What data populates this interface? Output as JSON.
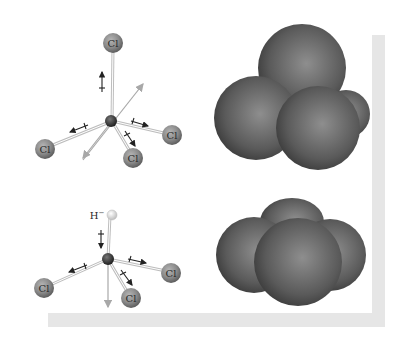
{
  "figure": {
    "molecules": [
      {
        "name": "carbon tetrachloride",
        "model": "ball-and-stick",
        "central_atom": "C",
        "atoms": [
          {
            "label": "Cl",
            "position": "top"
          },
          {
            "label": "Cl",
            "position": "left"
          },
          {
            "label": "Cl",
            "position": "right"
          },
          {
            "label": "Cl",
            "position": "front"
          }
        ],
        "net_dipole": "none (bond dipoles cancel)"
      },
      {
        "name": "chloroform",
        "model": "ball-and-stick",
        "central_atom": "C",
        "atoms": [
          {
            "label": "H",
            "position": "top"
          },
          {
            "label": "Cl",
            "position": "left"
          },
          {
            "label": "Cl",
            "position": "right"
          },
          {
            "label": "Cl",
            "position": "front"
          }
        ],
        "net_dipole": "downward"
      }
    ],
    "labels": {
      "cl": "Cl",
      "h": "H",
      "h_charge": "−"
    },
    "space_filling": [
      {
        "name": "carbon tetrachloride space-filling model"
      },
      {
        "name": "chloroform space-filling model"
      }
    ],
    "colors": {
      "chlorine": "#8a8a8a",
      "carbon": "#3a3a3a",
      "hydrogen": "#e8e8e8",
      "space_fill": "#5a5a5a",
      "shadow": "#e6e6e6",
      "net_arrow": "#a8a8a8",
      "bond_arrow": "#222222"
    }
  }
}
